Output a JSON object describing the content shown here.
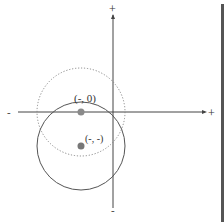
{
  "diagram": {
    "axes": {
      "x_positive_label": "+",
      "x_negative_label": "-",
      "y_positive_label": "+",
      "y_negative_label": "-"
    },
    "points": [
      {
        "label": "(-, 0)",
        "color": "#8a8a8a"
      },
      {
        "label": "(-, -)",
        "color": "#777777"
      }
    ],
    "circles": [
      {
        "style": "dotted",
        "center_label": "(-, 0)",
        "color": "#888888"
      },
      {
        "style": "solid",
        "center_label": "(-, -)",
        "color": "#555555"
      }
    ]
  }
}
